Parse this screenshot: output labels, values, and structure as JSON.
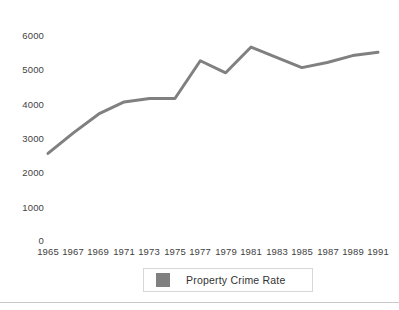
{
  "chart_data": {
    "type": "line",
    "title": "",
    "xlabel": "",
    "ylabel": "",
    "x": [
      1965,
      1967,
      1969,
      1971,
      1973,
      1975,
      1977,
      1979,
      1981,
      1983,
      1985,
      1987,
      1989,
      1991
    ],
    "xtick_labels": [
      "1965",
      "1967",
      "1969",
      "1971",
      "1973",
      "1975",
      "1977",
      "1979",
      "1981",
      "1983",
      "1985",
      "1987",
      "1989",
      "1991"
    ],
    "ytick_labels": [
      "6000",
      "5000",
      "4000",
      "3000",
      "2000",
      "1000",
      "0"
    ],
    "ytick_values": [
      6000,
      5000,
      4000,
      3000,
      2000,
      1000,
      0
    ],
    "ylim": [
      0,
      6000
    ],
    "xlim": [
      1965,
      1991
    ],
    "grid": false,
    "legend_position": "bottom",
    "series": [
      {
        "name": "Property Crime Rate",
        "color": "#808080",
        "values": [
          2550,
          3150,
          3700,
          4050,
          4150,
          4150,
          5250,
          4900,
          5650,
          5350,
          5050,
          5200,
          5400,
          5500
        ]
      }
    ]
  },
  "legend": {
    "label": "Property Crime Rate",
    "swatch_color": "#808080"
  },
  "style": {
    "line_color": "#808080",
    "axis_text_color": "#3f3f3f",
    "legend_border_color": "#d8d8d8",
    "rule_color": "#c9c9c9",
    "background": "#ffffff"
  }
}
